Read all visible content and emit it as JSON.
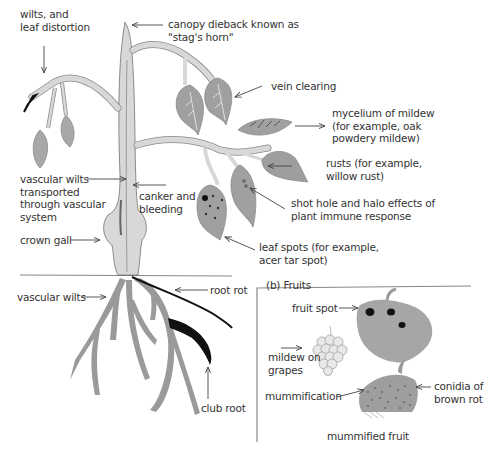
{
  "diagram": {
    "plant_labels": {
      "wilts": [
        "wilts, and",
        "leaf distortion"
      ],
      "canopy_dieback": [
        "canopy dieback known as",
        "\"stag's horn\""
      ],
      "vein_clearing": "vein clearing",
      "mycelium": [
        "mycelium of mildew",
        "(for example, oak",
        "powdery mildew)"
      ],
      "rusts": [
        "rusts (for example,",
        "willow rust)"
      ],
      "shot_hole": [
        "shot hole and halo effects of",
        "plant immune response"
      ],
      "leaf_spots": [
        "leaf spots (for example,",
        "acer tar spot)"
      ],
      "vascular_wilts_transported": [
        "vascular wilts",
        "transported",
        "through vascular",
        "system"
      ],
      "canker": [
        "canker and",
        "bleeding"
      ],
      "crown_gall": "crown gall",
      "vascular_wilts_root": "vascular wilts",
      "root_rot": "root rot",
      "club_root": "club root"
    },
    "fruits_panel": {
      "title": "(b)  Fruits",
      "fruit_spot": "fruit spot",
      "mildew_on_grapes": [
        "mildew on",
        "grapes"
      ],
      "mummification": "mummification",
      "conidia": [
        "conidia of",
        "brown rot"
      ],
      "caption": "mummified fruit"
    },
    "colors": {
      "stem": "#d4d4d4",
      "stem_outline": "#8a8a8a",
      "leaf": "#a8a8a8",
      "root": "#9a9a9a",
      "disease_black": "#111111",
      "text": "#333333"
    }
  }
}
